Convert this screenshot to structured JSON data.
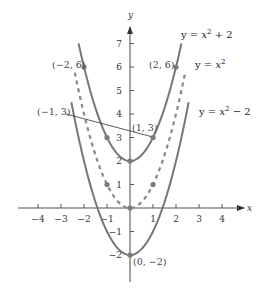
{
  "chart_data": {
    "type": "line",
    "title": "",
    "xlabel": "x",
    "ylabel": "y",
    "xlim": [
      -4.5,
      4.9
    ],
    "ylim": [
      -3.2,
      7.6
    ],
    "x_ticks": [
      -4,
      -3,
      -2,
      -1,
      1,
      2,
      3,
      4
    ],
    "y_ticks": [
      -2,
      -1,
      1,
      2,
      3,
      4,
      5,
      6,
      7
    ],
    "grid": false,
    "series": [
      {
        "name": "y = x² + 2",
        "expr": "x^2 + 2",
        "x_range": [
          -2.236,
          2.236
        ],
        "style": "solid",
        "color": "#777777",
        "label": {
          "text": "y = x² + 2",
          "x": 181,
          "y": 38
        }
      },
      {
        "name": "y = x²",
        "expr": "x^2",
        "x_range": [
          -2.4,
          2.4
        ],
        "style": "dashed",
        "color": "#888888",
        "label": {
          "text": "y = x²",
          "x": 195,
          "y": 68
        }
      },
      {
        "name": "y = x² − 2",
        "expr": "x^2 - 2",
        "x_range": [
          -2.55,
          2.55
        ],
        "style": "solid",
        "color": "#777777",
        "label": {
          "text": "y = x² − 2",
          "x": 199,
          "y": 115
        }
      }
    ],
    "points": [
      {
        "x": -2,
        "y": 6,
        "label": "(−2, 6)",
        "lx": 52,
        "ly": 68,
        "anchor": "start"
      },
      {
        "x": 2,
        "y": 6,
        "label": "(2, 6)",
        "lx": 149,
        "ly": 68,
        "anchor": "start"
      },
      {
        "x": -1,
        "y": 3,
        "label": "(−1, 3)",
        "lx": 37,
        "ly": 115,
        "anchor": "start",
        "leader": true
      },
      {
        "x": 1,
        "y": 3,
        "label": "(1, 3)",
        "lx": 132,
        "ly": 131,
        "anchor": "start"
      },
      {
        "x": 0,
        "y": 2,
        "label": "",
        "lx": 0,
        "ly": 0
      },
      {
        "x": -1,
        "y": 1,
        "label": "",
        "lx": 0,
        "ly": 0
      },
      {
        "x": 1,
        "y": 1,
        "label": "",
        "lx": 0,
        "ly": 0
      },
      {
        "x": 0,
        "y": 0,
        "label": "",
        "lx": 0,
        "ly": 0
      },
      {
        "x": 0,
        "y": -2,
        "label": "(0, −2)",
        "lx": 133,
        "ly": 265,
        "anchor": "start"
      }
    ]
  },
  "axes": {
    "x_name": "x",
    "y_name": "y"
  }
}
